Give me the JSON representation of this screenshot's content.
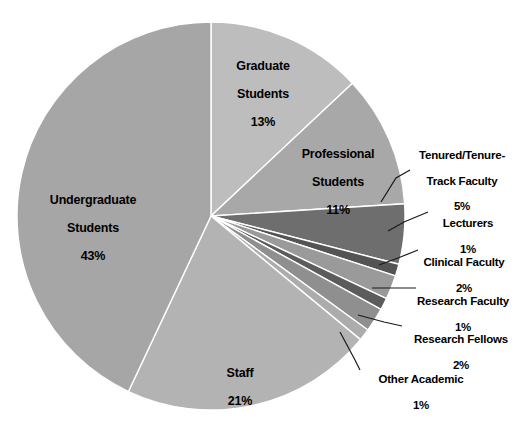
{
  "chart_data": {
    "type": "pie",
    "title": "",
    "subtitle": "",
    "xlabel": "",
    "ylabel": "",
    "legend_position": "none",
    "grid": false,
    "start_angle_deg": 0,
    "direction": "clockwise",
    "value_unit": "percent",
    "categories": [
      "Graduate Students",
      "Professional Students",
      "Tenured/Tenure-Track Faculty",
      "Lecturers",
      "Clinical Faculty",
      "Research Faculty",
      "Research Fellows",
      "Other Academic",
      "Staff",
      "Undergraduate Students"
    ],
    "values": [
      13,
      11,
      5,
      1,
      2,
      1,
      2,
      1,
      21,
      43
    ],
    "slices": [
      {
        "id": "graduate-students",
        "label": "Graduate Students",
        "label_line1": "Graduate",
        "label_line2": "Students",
        "value": 13,
        "value_text": "13%",
        "color": "#bdbdbd",
        "label_placement": "inside"
      },
      {
        "id": "professional-students",
        "label": "Professional Students",
        "label_line1": "Professional",
        "label_line2": "Students",
        "value": 11,
        "value_text": "11%",
        "color": "#a8a8a8",
        "label_placement": "inside"
      },
      {
        "id": "tenured-tenure-track-faculty",
        "label": "Tenured/Tenure-Track Faculty",
        "label_line1": "Tenured/Tenure-",
        "label_line2": "Track Faculty",
        "value": 5,
        "value_text": "5%",
        "color": "#6e6e6e",
        "label_placement": "outside"
      },
      {
        "id": "lecturers",
        "label": "Lecturers",
        "label_line1": "Lecturers",
        "label_line2": "",
        "value": 1,
        "value_text": "1%",
        "color": "#545454",
        "label_placement": "outside"
      },
      {
        "id": "clinical-faculty",
        "label": "Clinical Faculty",
        "label_line1": "Clinical Faculty",
        "label_line2": "",
        "value": 2,
        "value_text": "2%",
        "color": "#9a9a9a",
        "label_placement": "outside"
      },
      {
        "id": "research-faculty",
        "label": "Research Faculty",
        "label_line1": "Research Faculty",
        "label_line2": "",
        "value": 1,
        "value_text": "1%",
        "color": "#5c5c5c",
        "label_placement": "outside"
      },
      {
        "id": "research-fellows",
        "label": "Research Fellows",
        "label_line1": "Research Fellows",
        "label_line2": "",
        "value": 2,
        "value_text": "2%",
        "color": "#8f8f8f",
        "label_placement": "outside"
      },
      {
        "id": "other-academic",
        "label": "Other Academic",
        "label_line1": "Other Academic",
        "label_line2": "",
        "value": 1,
        "value_text": "1%",
        "color": "#acacac",
        "label_placement": "outside"
      },
      {
        "id": "staff",
        "label": "Staff",
        "label_line1": "Staff",
        "label_line2": "",
        "value": 21,
        "value_text": "21%",
        "color": "#b3b3b3",
        "label_placement": "inside"
      },
      {
        "id": "undergraduate-students",
        "label": "Undergraduate Students",
        "label_line1": "Undergraduate",
        "label_line2": "Students",
        "value": 43,
        "value_text": "43%",
        "color": "#a6a6a6",
        "label_placement": "inside"
      }
    ],
    "total": 100,
    "colors": {
      "background": "#ffffff",
      "slice_border": "#ffffff",
      "leader_line": "#1a1a1a",
      "label_text": "#000000"
    }
  }
}
